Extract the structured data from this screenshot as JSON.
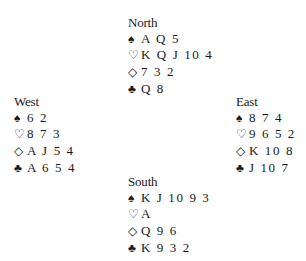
{
  "suits": {
    "spades": {
      "icon": "spade-icon",
      "glyph": "♠"
    },
    "hearts": {
      "icon": "heart-icon",
      "glyph": "♡"
    },
    "diamonds": {
      "icon": "diamond-icon",
      "glyph": "◇"
    },
    "clubs": {
      "icon": "club-icon",
      "glyph": "♣"
    }
  },
  "hands": {
    "north": {
      "player": "North",
      "spades": "A Q 5",
      "hearts": "K Q J 10 4",
      "diamonds": "7 3 2",
      "clubs": "Q 8"
    },
    "west": {
      "player": "West",
      "spades": "6 2",
      "hearts": "8 7 3",
      "diamonds": "A J 5 4",
      "clubs": "A 6 5 4"
    },
    "east": {
      "player": "East",
      "spades": "8 7 4",
      "hearts": "9 6 5 2",
      "diamonds": "K 10 8",
      "clubs": "J 10 7"
    },
    "south": {
      "player": "South",
      "spades": "K J 10 9 3",
      "hearts": "A",
      "diamonds": "Q 9 6",
      "clubs": "K 9 3 2"
    }
  }
}
